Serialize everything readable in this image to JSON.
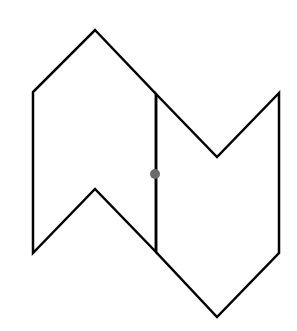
{
  "diagram": {
    "type": "line-drawing",
    "canvas": {
      "width": 297,
      "height": 331,
      "background": "#ffffff"
    },
    "stroke_color": "#000000",
    "stroke_width": 2.5,
    "shapes": [
      {
        "name": "left-pentagon-chevron",
        "points": [
          [
            95,
            30
          ],
          [
            156,
            94
          ],
          [
            156,
            252
          ],
          [
            95,
            189
          ],
          [
            33,
            253
          ],
          [
            33,
            92
          ]
        ]
      },
      {
        "name": "right-pentagon-chevron",
        "points": [
          [
            156,
            94
          ],
          [
            217,
            157
          ],
          [
            279,
            93
          ],
          [
            279,
            253
          ],
          [
            217,
            317
          ],
          [
            156,
            252
          ]
        ]
      }
    ],
    "shared_edge": {
      "from": [
        156,
        94
      ],
      "to": [
        156,
        252
      ]
    },
    "point": {
      "cx": 155,
      "cy": 174,
      "r": 5,
      "color": "#6b6b6b"
    }
  }
}
